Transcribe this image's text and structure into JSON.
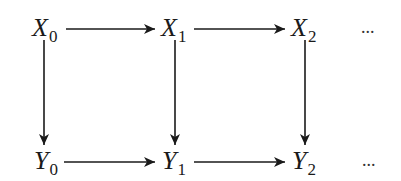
{
  "diagram": {
    "type": "commutative-diagram",
    "colors": {
      "ink": "#1a1a1a",
      "background": "#ffffff"
    },
    "nodes": [
      {
        "id": "X0",
        "base": "X",
        "sub": "0",
        "row": 0,
        "col": 0
      },
      {
        "id": "X1",
        "base": "X",
        "sub": "1",
        "row": 0,
        "col": 1
      },
      {
        "id": "X2",
        "base": "X",
        "sub": "2",
        "row": 0,
        "col": 2
      },
      {
        "id": "Y0",
        "base": "Y",
        "sub": "0",
        "row": 1,
        "col": 0
      },
      {
        "id": "Y1",
        "base": "Y",
        "sub": "1",
        "row": 1,
        "col": 1
      },
      {
        "id": "Y2",
        "base": "Y",
        "sub": "2",
        "row": 1,
        "col": 2
      }
    ],
    "continuation": {
      "top": "...",
      "bottom": "..."
    },
    "edges": [
      {
        "from": "X0",
        "to": "X1",
        "direction": "right"
      },
      {
        "from": "X1",
        "to": "X2",
        "direction": "right"
      },
      {
        "from": "Y0",
        "to": "Y1",
        "direction": "right"
      },
      {
        "from": "Y1",
        "to": "Y2",
        "direction": "right"
      },
      {
        "from": "X0",
        "to": "Y0",
        "direction": "down"
      },
      {
        "from": "X1",
        "to": "Y1",
        "direction": "down"
      },
      {
        "from": "X2",
        "to": "Y2",
        "direction": "down"
      }
    ]
  }
}
